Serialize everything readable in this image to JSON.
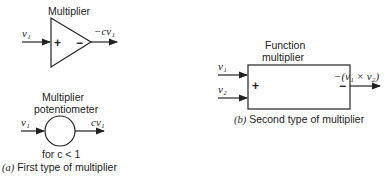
{
  "diagram_a": {
    "caption_prefix": "(a)",
    "caption_text": " First type of multiplier",
    "amplifier": {
      "label": "Multiplier",
      "input": "v₁",
      "plus": "+",
      "minus": "−",
      "output": "−cv₁"
    },
    "potentiometer": {
      "label_line1": "Multiplier",
      "label_line2": "potentiometer",
      "input": "v₁",
      "output": "cv₁",
      "condition": "for c < 1"
    }
  },
  "diagram_b": {
    "caption_prefix": "(b)",
    "caption_text": " Second type of multiplier",
    "label_line1": "Function",
    "label_line2": "multiplier",
    "input1": "v₁",
    "input2": "v₂",
    "plus": "+",
    "minus": "−",
    "output": "−(v₁ × v₂)"
  }
}
